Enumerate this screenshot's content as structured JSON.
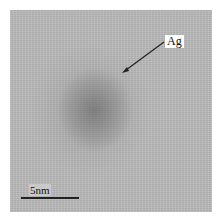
{
  "image": {
    "description": "TEM micrograph of a single silver nanoparticle",
    "background_color": "#b9b9b9",
    "particle_color": "#7a7a7a"
  },
  "annotation": {
    "label": "Ag",
    "arrow": {
      "from": [
        164,
        42
      ],
      "to": [
        123,
        72
      ]
    }
  },
  "scale_bar": {
    "label": "5nm",
    "length_px": 58
  },
  "caption": {
    "text": ""
  }
}
